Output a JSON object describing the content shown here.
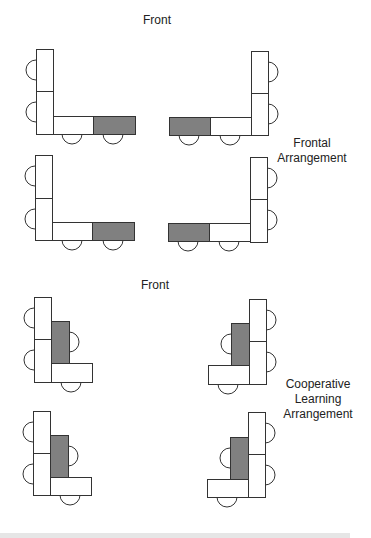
{
  "colors": {
    "stroke": "#333333",
    "desk_fill": "#ffffff",
    "teacher_fill": "#808080",
    "background": "#ffffff"
  },
  "sections": [
    {
      "id": "frontal",
      "front_label": "Front",
      "arrangement_label_lines": [
        "Frontal",
        "Arrangement"
      ],
      "front_pos": [
        157,
        20
      ],
      "label_pos": [
        312,
        143
      ],
      "groups": [
        {
          "name": "frontal-group-top-left",
          "desks": [
            {
              "x": 36,
              "y": 49,
              "w": 17,
              "h": 42,
              "type": "student"
            },
            {
              "x": 36,
              "y": 91,
              "w": 17,
              "h": 43,
              "type": "student"
            },
            {
              "x": 53,
              "y": 116,
              "w": 40,
              "h": 18,
              "type": "student"
            },
            {
              "x": 93,
              "y": 116,
              "w": 42,
              "h": 18,
              "type": "teacher"
            }
          ],
          "chairs": [
            {
              "cx": 36,
              "cy": 70,
              "dir": "left"
            },
            {
              "cx": 36,
              "cy": 112,
              "dir": "left"
            },
            {
              "cx": 72,
              "cy": 134,
              "dir": "down"
            },
            {
              "cx": 113,
              "cy": 134,
              "dir": "down"
            }
          ]
        },
        {
          "name": "frontal-group-top-right",
          "desks": [
            {
              "x": 251,
              "y": 51,
              "w": 17,
              "h": 42,
              "type": "student"
            },
            {
              "x": 251,
              "y": 93,
              "w": 17,
              "h": 42,
              "type": "student"
            },
            {
              "x": 210,
              "y": 117,
              "w": 41,
              "h": 18,
              "type": "student"
            },
            {
              "x": 169,
              "y": 117,
              "w": 41,
              "h": 18,
              "type": "teacher"
            }
          ],
          "chairs": [
            {
              "cx": 268,
              "cy": 72,
              "dir": "right"
            },
            {
              "cx": 268,
              "cy": 114,
              "dir": "right"
            },
            {
              "cx": 230,
              "cy": 135,
              "dir": "down"
            },
            {
              "cx": 189,
              "cy": 135,
              "dir": "down"
            }
          ]
        },
        {
          "name": "frontal-group-bottom-left",
          "desks": [
            {
              "x": 35,
              "y": 155,
              "w": 17,
              "h": 43,
              "type": "student"
            },
            {
              "x": 35,
              "y": 198,
              "w": 17,
              "h": 42,
              "type": "student"
            },
            {
              "x": 52,
              "y": 222,
              "w": 40,
              "h": 18,
              "type": "student"
            },
            {
              "x": 92,
              "y": 222,
              "w": 42,
              "h": 18,
              "type": "teacher"
            }
          ],
          "chairs": [
            {
              "cx": 35,
              "cy": 176,
              "dir": "left"
            },
            {
              "cx": 35,
              "cy": 219,
              "dir": "left"
            },
            {
              "cx": 72,
              "cy": 240,
              "dir": "down"
            },
            {
              "cx": 113,
              "cy": 240,
              "dir": "down"
            }
          ]
        },
        {
          "name": "frontal-group-bottom-right",
          "desks": [
            {
              "x": 250,
              "y": 157,
              "w": 17,
              "h": 42,
              "type": "student"
            },
            {
              "x": 250,
              "y": 199,
              "w": 17,
              "h": 43,
              "type": "student"
            },
            {
              "x": 209,
              "y": 223,
              "w": 41,
              "h": 18,
              "type": "student"
            },
            {
              "x": 168,
              "y": 223,
              "w": 41,
              "h": 18,
              "type": "teacher"
            }
          ],
          "chairs": [
            {
              "cx": 267,
              "cy": 178,
              "dir": "right"
            },
            {
              "cx": 267,
              "cy": 220,
              "dir": "right"
            },
            {
              "cx": 229,
              "cy": 241,
              "dir": "down"
            },
            {
              "cx": 188,
              "cy": 241,
              "dir": "down"
            }
          ]
        }
      ]
    },
    {
      "id": "cooperative",
      "front_label": "Front",
      "arrangement_label_lines": [
        "Cooperative",
        "Learning",
        "Arrangement"
      ],
      "front_pos": [
        155,
        285
      ],
      "label_pos": [
        318,
        384
      ],
      "groups": [
        {
          "name": "cooperative-group-top-left",
          "desks": [
            {
              "x": 34,
              "y": 297,
              "w": 17,
              "h": 42,
              "type": "student"
            },
            {
              "x": 34,
              "y": 339,
              "w": 17,
              "h": 43,
              "type": "student"
            },
            {
              "x": 51,
              "y": 321,
              "w": 18,
              "h": 42,
              "type": "teacher"
            },
            {
              "x": 51,
              "y": 363,
              "w": 41,
              "h": 19,
              "type": "student"
            }
          ],
          "chairs": [
            {
              "cx": 34,
              "cy": 318,
              "dir": "left"
            },
            {
              "cx": 34,
              "cy": 360,
              "dir": "left"
            },
            {
              "cx": 69,
              "cy": 342,
              "dir": "right"
            },
            {
              "cx": 71,
              "cy": 382,
              "dir": "down"
            }
          ]
        },
        {
          "name": "cooperative-group-top-right",
          "desks": [
            {
              "x": 249,
              "y": 299,
              "w": 17,
              "h": 42,
              "type": "student"
            },
            {
              "x": 249,
              "y": 341,
              "w": 17,
              "h": 43,
              "type": "student"
            },
            {
              "x": 231,
              "y": 323,
              "w": 18,
              "h": 42,
              "type": "teacher"
            },
            {
              "x": 208,
              "y": 365,
              "w": 41,
              "h": 19,
              "type": "student"
            }
          ],
          "chairs": [
            {
              "cx": 266,
              "cy": 320,
              "dir": "right"
            },
            {
              "cx": 266,
              "cy": 362,
              "dir": "right"
            },
            {
              "cx": 231,
              "cy": 344,
              "dir": "left"
            },
            {
              "cx": 228,
              "cy": 384,
              "dir": "down"
            }
          ]
        },
        {
          "name": "cooperative-group-bottom-left",
          "desks": [
            {
              "x": 33,
              "y": 411,
              "w": 17,
              "h": 42,
              "type": "student"
            },
            {
              "x": 33,
              "y": 453,
              "w": 17,
              "h": 42,
              "type": "student"
            },
            {
              "x": 50,
              "y": 435,
              "w": 18,
              "h": 42,
              "type": "teacher"
            },
            {
              "x": 50,
              "y": 477,
              "w": 41,
              "h": 18,
              "type": "student"
            }
          ],
          "chairs": [
            {
              "cx": 33,
              "cy": 432,
              "dir": "left"
            },
            {
              "cx": 33,
              "cy": 474,
              "dir": "left"
            },
            {
              "cx": 68,
              "cy": 456,
              "dir": "right"
            },
            {
              "cx": 70,
              "cy": 495,
              "dir": "down"
            }
          ]
        },
        {
          "name": "cooperative-group-bottom-right",
          "desks": [
            {
              "x": 248,
              "y": 412,
              "w": 17,
              "h": 42,
              "type": "student"
            },
            {
              "x": 248,
              "y": 454,
              "w": 17,
              "h": 43,
              "type": "student"
            },
            {
              "x": 230,
              "y": 437,
              "w": 18,
              "h": 42,
              "type": "teacher"
            },
            {
              "x": 207,
              "y": 479,
              "w": 41,
              "h": 18,
              "type": "student"
            }
          ],
          "chairs": [
            {
              "cx": 265,
              "cy": 433,
              "dir": "right"
            },
            {
              "cx": 265,
              "cy": 475,
              "dir": "right"
            },
            {
              "cx": 230,
              "cy": 458,
              "dir": "left"
            },
            {
              "cx": 227,
              "cy": 497,
              "dir": "down"
            }
          ]
        }
      ]
    }
  ]
}
